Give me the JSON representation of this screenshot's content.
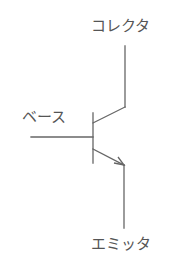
{
  "diagram": {
    "type": "npn-transistor-symbol",
    "labels": {
      "collector": "コレクタ",
      "base": "ベース",
      "emitter": "エミッタ"
    },
    "colors": {
      "line": "#666666",
      "text": "#555555",
      "background": "#ffffff"
    }
  }
}
